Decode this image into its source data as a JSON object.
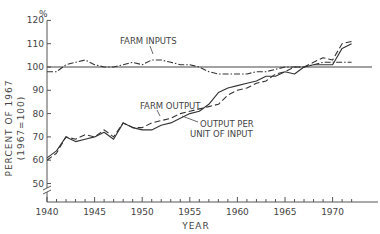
{
  "chart_data": {
    "type": "line",
    "title": "",
    "xlabel": "YEAR",
    "ylabel": "PERCENT OF 1967",
    "ylabel_sub": "(1967=100)",
    "y_unit_label": "%",
    "xlim": [
      1940,
      1974
    ],
    "ylim": [
      45,
      120
    ],
    "y_axis_break": true,
    "grid": false,
    "reference_line": 100,
    "x_ticks": [
      "1940",
      "1945",
      "1950",
      "1955",
      "1960",
      "1965",
      "1970"
    ],
    "y_ticks": [
      "50",
      "60",
      "70",
      "80",
      "90",
      "100",
      "110",
      "120"
    ],
    "x": [
      1940,
      1941,
      1942,
      1943,
      1944,
      1945,
      1946,
      1947,
      1948,
      1949,
      1950,
      1951,
      1952,
      1953,
      1954,
      1955,
      1956,
      1957,
      1958,
      1959,
      1960,
      1961,
      1962,
      1963,
      1964,
      1965,
      1966,
      1967,
      1968,
      1969,
      1970,
      1971,
      1972
    ],
    "series": [
      {
        "name": "FARM INPUTS",
        "style": "dash-dot",
        "values": [
          98,
          98,
          101,
          102,
          103,
          101,
          100,
          100,
          101,
          102,
          101,
          103,
          103,
          102,
          101,
          101,
          100,
          98,
          97,
          97,
          97,
          97,
          98,
          98,
          99,
          100,
          100,
          100,
          101,
          102,
          102,
          102,
          102
        ]
      },
      {
        "name": "FARM OUTPUT",
        "style": "dashed",
        "values": [
          60,
          63,
          70,
          69,
          71,
          70,
          73,
          70,
          76,
          74,
          74,
          76,
          77,
          78,
          80,
          81,
          82,
          83,
          84,
          88,
          90,
          91,
          93,
          94,
          97,
          98,
          100,
          100,
          102,
          104,
          103,
          110,
          111
        ]
      },
      {
        "name": "OUTPUT PER UNIT OF INPUT",
        "style": "solid",
        "values": [
          61,
          64,
          70,
          68,
          69,
          70,
          72,
          69,
          76,
          74,
          73,
          73,
          75,
          76,
          78,
          80,
          81,
          84,
          89,
          91,
          92,
          93,
          94,
          96,
          96,
          98,
          97,
          100,
          101,
          101,
          101,
          108,
          110
        ]
      }
    ],
    "annotations": [
      {
        "text": "FARM INPUTS",
        "x": 1951,
        "y": 108
      },
      {
        "text": "FARM OUTPUT",
        "x": 1953,
        "y": 90
      },
      {
        "text": "OUTPUT PER",
        "x": 1956.5,
        "y": 79
      },
      {
        "text": "UNIT OF INPUT",
        "x": 1955.5,
        "y": 75
      }
    ],
    "legend": "inline annotations"
  },
  "labels": {
    "y_unit": "%",
    "ylabel_main": "PERCENT OF 1967",
    "ylabel_sub": "(1967=100)",
    "xlabel": "YEAR",
    "farm_inputs": "FARM INPUTS",
    "farm_output": "FARM OUTPUT",
    "output_per_1": "OUTPUT PER",
    "output_per_2": "UNIT OF INPUT"
  }
}
